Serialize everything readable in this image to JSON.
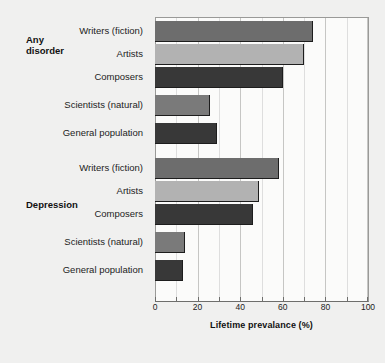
{
  "chart_data": {
    "type": "bar",
    "orientation": "horizontal",
    "title": "",
    "xlabel": "Lifetime prevalance (%)",
    "ylabel": "",
    "xlim": [
      0,
      100
    ],
    "xticks": [
      0,
      20,
      40,
      60,
      80,
      100
    ],
    "xtick_labels": [
      "0",
      "20",
      "40",
      "60",
      "80",
      "100"
    ],
    "grid": true,
    "legend": "none",
    "groups": [
      {
        "name": "Any disorder",
        "label": "Any\ndisorder",
        "categories": [
          "Writers (fiction)",
          "Artists",
          "Composers",
          "Scientists (natural)",
          "General population"
        ],
        "values": [
          74,
          70,
          60,
          26,
          29
        ],
        "colors": [
          "#6d6d6d",
          "#b2b2b2",
          "#383838",
          "#7a7a7a",
          "#383838"
        ]
      },
      {
        "name": "Depression",
        "label": "Depression",
        "categories": [
          "Writers (fiction)",
          "Artists",
          "Composers",
          "Scientists (natural)",
          "General population"
        ],
        "values": [
          58,
          49,
          46,
          14,
          13
        ],
        "colors": [
          "#6d6d6d",
          "#b2b2b2",
          "#383838",
          "#7a7a7a",
          "#383838"
        ]
      }
    ]
  },
  "colors": {
    "figure_background": "#f0f0ef",
    "plot_background": "#fbfbfa",
    "gridline": "#c6c6c4",
    "axis": "#6e6e6c",
    "text": "#1c1c1c",
    "bar_dark": "#383838",
    "bar_medium": "#6d6d6d",
    "bar_light": "#b2b2b2"
  }
}
